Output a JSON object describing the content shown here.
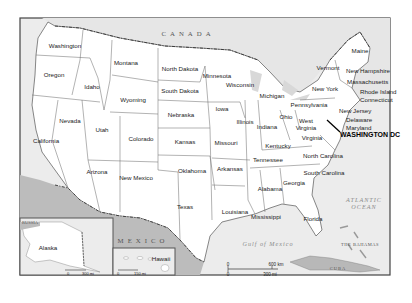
{
  "map": {
    "title": "United States",
    "countries": [
      {
        "name": "CANADA",
        "x": 188,
        "y": 33
      },
      {
        "name": "MEXICO",
        "x": 143,
        "y": 240
      },
      {
        "name": "CUBA",
        "x": 338,
        "y": 268
      },
      {
        "name": "RUSSIA",
        "x": 34,
        "y": 223
      },
      {
        "name": "THE BAHAMAS",
        "x": 360,
        "y": 244
      }
    ],
    "water": [
      {
        "name": "ATLANTIC OCEAN",
        "x": 364,
        "y": 203
      },
      {
        "name": "Gulf of Mexico",
        "x": 268,
        "y": 243
      }
    ],
    "states": [
      {
        "name": "Washington",
        "x": 65,
        "y": 45
      },
      {
        "name": "Oregon",
        "x": 54,
        "y": 74
      },
      {
        "name": "California",
        "x": 46,
        "y": 140
      },
      {
        "name": "Nevada",
        "x": 70,
        "y": 120
      },
      {
        "name": "Idaho",
        "x": 92,
        "y": 86
      },
      {
        "name": "Montana",
        "x": 126,
        "y": 62
      },
      {
        "name": "Wyoming",
        "x": 133,
        "y": 99
      },
      {
        "name": "Utah",
        "x": 102,
        "y": 129
      },
      {
        "name": "Colorado",
        "x": 141,
        "y": 138
      },
      {
        "name": "Arizona",
        "x": 97,
        "y": 171
      },
      {
        "name": "New Mexico",
        "x": 136,
        "y": 177
      },
      {
        "name": "North Dakota",
        "x": 180,
        "y": 68
      },
      {
        "name": "South Dakota",
        "x": 180,
        "y": 90
      },
      {
        "name": "Nebraska",
        "x": 181,
        "y": 114
      },
      {
        "name": "Kansas",
        "x": 185,
        "y": 141
      },
      {
        "name": "Oklahoma",
        "x": 192,
        "y": 170
      },
      {
        "name": "Texas",
        "x": 185,
        "y": 206
      },
      {
        "name": "Minnesota",
        "x": 217,
        "y": 75
      },
      {
        "name": "Iowa",
        "x": 222,
        "y": 108
      },
      {
        "name": "Missouri",
        "x": 226,
        "y": 142
      },
      {
        "name": "Arkansas",
        "x": 230,
        "y": 168
      },
      {
        "name": "Louisiana",
        "x": 235,
        "y": 211
      },
      {
        "name": "Wisconsin",
        "x": 240,
        "y": 84
      },
      {
        "name": "Illinois",
        "x": 245,
        "y": 121
      },
      {
        "name": "Michigan",
        "x": 272,
        "y": 95
      },
      {
        "name": "Indiana",
        "x": 267,
        "y": 126
      },
      {
        "name": "Ohio",
        "x": 286,
        "y": 116
      },
      {
        "name": "Kentucky",
        "x": 278,
        "y": 145
      },
      {
        "name": "Tennessee",
        "x": 268,
        "y": 159
      },
      {
        "name": "Mississippi",
        "x": 266,
        "y": 216
      },
      {
        "name": "Alabama",
        "x": 270,
        "y": 188
      },
      {
        "name": "Georgia",
        "x": 294,
        "y": 182
      },
      {
        "name": "Florida",
        "x": 313,
        "y": 218
      },
      {
        "name": "South Carolina",
        "x": 324,
        "y": 172
      },
      {
        "name": "North Carolina",
        "x": 323,
        "y": 155
      },
      {
        "name": "Virginia",
        "x": 312,
        "y": 137
      },
      {
        "name": "West Virginia",
        "x": 306,
        "y": 124
      },
      {
        "name": "Pennsylvania",
        "x": 309,
        "y": 104
      },
      {
        "name": "New York",
        "x": 325,
        "y": 88
      },
      {
        "name": "Vermont",
        "x": 328,
        "y": 67
      },
      {
        "name": "Maine",
        "x": 360,
        "y": 50
      }
    ],
    "callouts": [
      {
        "name": "New Hampshire",
        "x": 346,
        "y": 70
      },
      {
        "name": "Massachusetts",
        "x": 347,
        "y": 81
      },
      {
        "name": "Rhode Island",
        "x": 360,
        "y": 91
      },
      {
        "name": "Connecticut",
        "x": 360,
        "y": 99
      },
      {
        "name": "New Jersey",
        "x": 339,
        "y": 110
      },
      {
        "name": "Delaware",
        "x": 346,
        "y": 119
      },
      {
        "name": "Maryland",
        "x": 346,
        "y": 127
      }
    ],
    "capital": {
      "name": "WASHINGTON DC",
      "x": 340,
      "y": 135
    },
    "insets": {
      "alaska": {
        "label": "Alaska",
        "scale_zero": "0",
        "scale_label": "300 mi"
      },
      "hawaii": {
        "label": "Hawaii",
        "scale_zero": "0",
        "scale_label": "150 mi"
      }
    },
    "scale": {
      "zero_top": "0",
      "zero_bottom": "0",
      "km_label": "600 km",
      "mi_label": "300 mi"
    },
    "colors": {
      "land_us": "#ffffff",
      "land_foreign": "#e4e4e4",
      "mexico": "#bcbcbc",
      "cuba": "#b8b8b8",
      "water": "#ececec",
      "border": "#555555"
    }
  }
}
